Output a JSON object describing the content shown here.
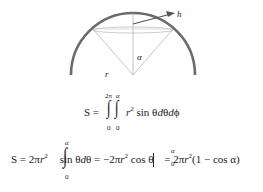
{
  "diagram": {
    "labels": {
      "h": "h",
      "alpha": "α",
      "r": "r"
    },
    "colors": {
      "arc": "#6b6b6b",
      "lines": "#aaaaaa",
      "arrow": "#555555"
    }
  },
  "equation1": {
    "lhs": "S =",
    "integrand": "r",
    "exp": "2",
    "rest": " sin θ",
    "d1": "d",
    "theta": "θ",
    "d2": "d",
    "phi": "ϕ",
    "outer_upper": "2π",
    "inner_upper": "α",
    "outer_lower": "0",
    "inner_lower": "0"
  },
  "equation2": {
    "lhs": "S = 2π",
    "r1": "r",
    "exp1": "2",
    "integrand": "sin θ",
    "d": "d",
    "theta": "θ = −2π",
    "r2": "r",
    "exp2": "2",
    "cos": " cos θ",
    "eval_upper": "α",
    "eval_lower": "0",
    "eq3": " = 2π",
    "r3": "r",
    "exp3": "2",
    "result": "(1 − cos α)",
    "int_upper": "α",
    "int_lower": "0"
  }
}
